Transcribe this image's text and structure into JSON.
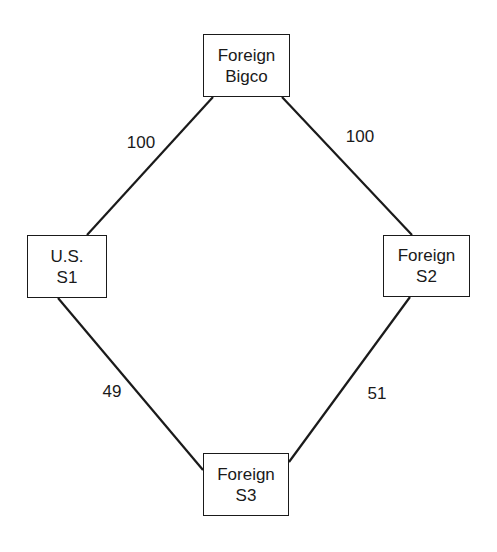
{
  "diagram": {
    "type": "ownership-structure",
    "nodes": [
      {
        "id": "bigco",
        "line1": "Foreign",
        "line2": "Bigco",
        "x": 203,
        "y": 34,
        "w": 87,
        "h": 63
      },
      {
        "id": "s1",
        "line1": "U.S.",
        "line2": "S1",
        "x": 27,
        "y": 235,
        "w": 80,
        "h": 63
      },
      {
        "id": "s2",
        "line1": "Foreign",
        "line2": "S2",
        "x": 383,
        "y": 235,
        "w": 87,
        "h": 62
      },
      {
        "id": "s3",
        "line1": "Foreign",
        "line2": "S3",
        "x": 203,
        "y": 453,
        "w": 86,
        "h": 63
      }
    ],
    "edges": [
      {
        "from": "bigco",
        "to": "s1",
        "label": "100",
        "x1": 213,
        "y1": 97,
        "x2": 87,
        "y2": 235,
        "lx": 141,
        "ly": 143
      },
      {
        "from": "bigco",
        "to": "s2",
        "label": "100",
        "x1": 282,
        "y1": 97,
        "x2": 412,
        "y2": 235,
        "lx": 360,
        "ly": 137
      },
      {
        "from": "s1",
        "to": "s3",
        "label": "49",
        "x1": 58,
        "y1": 298,
        "x2": 203,
        "y2": 470,
        "lx": 112,
        "ly": 392
      },
      {
        "from": "s2",
        "to": "s3",
        "label": "51",
        "x1": 410,
        "y1": 297,
        "x2": 289,
        "y2": 462,
        "lx": 377,
        "ly": 394
      }
    ],
    "colors": {
      "line": "#1a1a1a",
      "background": "#ffffff"
    }
  }
}
